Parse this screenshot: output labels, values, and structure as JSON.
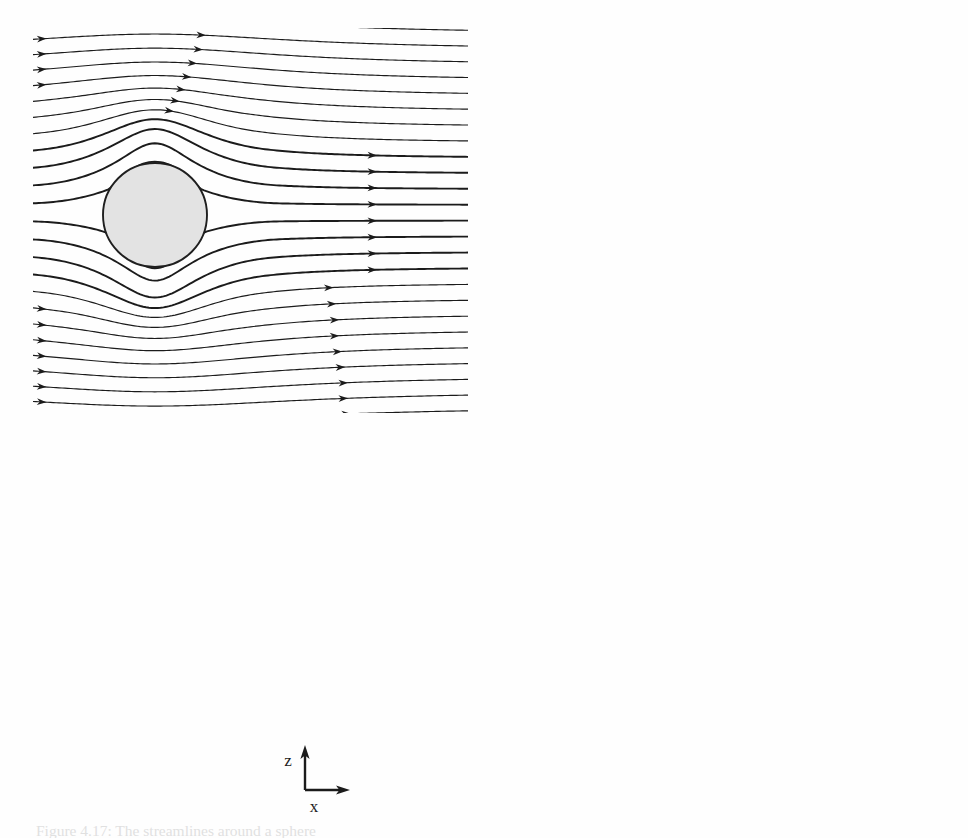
{
  "figure": {
    "kind": "streamline-flow-visualization",
    "background_color": "#fefefe",
    "ink_color": "#1b1b1b",
    "sphere_fill": "#e3e3e3",
    "sphere_stroke": "#1f1f1f",
    "panel_count": 3
  },
  "axes": {
    "z_label": "z",
    "x_label": "x",
    "origin_x": 305,
    "origin_y": 790,
    "z_arrow_length": 38,
    "x_arrow_length": 40
  },
  "caption": {
    "text": "Figure 4.17: The streamlines around a sphere",
    "visible": "partially-cropped"
  },
  "panels": [
    {
      "id": "panel-top-left",
      "position": "top-left",
      "label": "attached-flow",
      "x": 33,
      "y": 28,
      "width": 435,
      "height": 385,
      "sphere": {
        "cx": 122,
        "cy": 187,
        "r": 52
      },
      "wake": "none",
      "vortices": 0,
      "streamline_count": 25
    },
    {
      "id": "panel-top-right",
      "position": "top-right",
      "label": "small-separation-bubble",
      "x": 508,
      "y": 28,
      "width": 437,
      "height": 385,
      "sphere": {
        "cx": 130,
        "cy": 187,
        "r": 52
      },
      "wake": "short-recirculation",
      "vortices": 2,
      "wake_length": 78,
      "streamline_count": 25
    },
    {
      "id": "panel-bottom",
      "position": "bottom-center",
      "label": "large-recirculation-wake",
      "x": 330,
      "y": 443,
      "width": 415,
      "height": 370,
      "sphere": {
        "cx": 115,
        "cy": 175,
        "r": 52
      },
      "wake": "long-recirculation",
      "vortices": 2,
      "wake_length": 180,
      "streamline_count": 24
    }
  ],
  "chart_data": {
    "type": "line",
    "xlabel": "x",
    "ylabel": "z",
    "grid": false,
    "legend": null,
    "series": [
      {
        "name": "attached flow (no separation)",
        "panel": "panel-top-left",
        "separation": false,
        "recirculation_length_over_diameter": 0.0,
        "vortex_centers": []
      },
      {
        "name": "incipient separation (short bubble)",
        "panel": "panel-top-right",
        "separation": true,
        "recirculation_length_over_diameter": 0.75,
        "vortex_centers": [
          {
            "x": 1.15,
            "z": 0.3
          },
          {
            "x": 1.15,
            "z": -0.3
          }
        ]
      },
      {
        "name": "developed recirculation wake (twin vortices)",
        "panel": "panel-bottom",
        "separation": true,
        "recirculation_length_over_diameter": 1.75,
        "vortex_centers": [
          {
            "x": 0.95,
            "z": 0.38
          },
          {
            "x": 0.95,
            "z": -0.38
          }
        ]
      }
    ]
  }
}
